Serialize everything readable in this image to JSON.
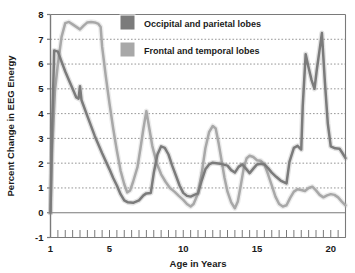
{
  "chart_data": {
    "type": "line",
    "title": "",
    "xlabel": "Age in Years",
    "ylabel": "Percent Change in EEG Energy",
    "xlim": [
      1,
      21
    ],
    "ylim": [
      -1,
      8
    ],
    "xticks": [
      1,
      5,
      10,
      15,
      20
    ],
    "yticks": [
      -1,
      0,
      1,
      2,
      3,
      4,
      5,
      6,
      7,
      8
    ],
    "xtick_labels": [
      "1",
      "5",
      "10",
      "15",
      "20"
    ],
    "ytick_labels": [
      "-1",
      "0",
      "1",
      "2",
      "3",
      "4",
      "5",
      "6",
      "7",
      "8"
    ],
    "grid": "horizontal-dotted",
    "minor_xticks_step": 0.5,
    "legend_position": "top-center",
    "series": [
      {
        "name": "Occipital and parietal lobes",
        "color": "#7b7b7b",
        "points": [
          [
            1.0,
            0.0
          ],
          [
            1.1,
            3.2
          ],
          [
            1.25,
            6.55
          ],
          [
            1.5,
            6.5
          ],
          [
            1.75,
            6.1
          ],
          [
            2.0,
            5.7
          ],
          [
            2.25,
            5.35
          ],
          [
            2.5,
            5.0
          ],
          [
            2.75,
            4.65
          ],
          [
            2.9,
            4.6
          ],
          [
            3.0,
            5.1
          ],
          [
            3.1,
            4.55
          ],
          [
            3.5,
            3.9
          ],
          [
            4.0,
            3.1
          ],
          [
            4.5,
            2.4
          ],
          [
            5.0,
            1.75
          ],
          [
            5.25,
            1.4
          ],
          [
            5.5,
            1.1
          ],
          [
            5.75,
            0.75
          ],
          [
            6.0,
            0.5
          ],
          [
            6.25,
            0.42
          ],
          [
            6.6,
            0.4
          ],
          [
            7.0,
            0.5
          ],
          [
            7.3,
            0.7
          ],
          [
            7.5,
            0.78
          ],
          [
            7.8,
            0.8
          ],
          [
            8.0,
            1.6
          ],
          [
            8.25,
            2.35
          ],
          [
            8.5,
            2.68
          ],
          [
            8.75,
            2.62
          ],
          [
            9.0,
            2.35
          ],
          [
            9.25,
            1.9
          ],
          [
            9.5,
            1.5
          ],
          [
            9.75,
            1.1
          ],
          [
            10.0,
            0.8
          ],
          [
            10.25,
            0.68
          ],
          [
            10.5,
            0.65
          ],
          [
            10.75,
            0.72
          ],
          [
            11.0,
            0.78
          ],
          [
            11.25,
            1.3
          ],
          [
            11.5,
            1.75
          ],
          [
            11.75,
            1.95
          ],
          [
            12.0,
            2.02
          ],
          [
            12.5,
            1.98
          ],
          [
            13.0,
            1.9
          ],
          [
            13.25,
            1.72
          ],
          [
            13.5,
            1.62
          ],
          [
            13.75,
            1.85
          ],
          [
            14.0,
            1.95
          ],
          [
            14.25,
            1.78
          ],
          [
            14.5,
            1.6
          ],
          [
            14.75,
            1.78
          ],
          [
            15.0,
            1.95
          ],
          [
            15.25,
            1.98
          ],
          [
            15.5,
            1.95
          ],
          [
            15.75,
            1.8
          ],
          [
            16.0,
            1.62
          ],
          [
            16.3,
            1.45
          ],
          [
            16.6,
            1.3
          ],
          [
            17.0,
            1.18
          ],
          [
            17.2,
            2.05
          ],
          [
            17.5,
            2.62
          ],
          [
            17.75,
            2.7
          ],
          [
            18.0,
            2.55
          ],
          [
            18.1,
            4.3
          ],
          [
            18.3,
            6.4
          ],
          [
            18.5,
            5.85
          ],
          [
            18.7,
            5.35
          ],
          [
            18.9,
            5.0
          ],
          [
            19.05,
            5.75
          ],
          [
            19.25,
            6.6
          ],
          [
            19.4,
            7.25
          ],
          [
            19.6,
            5.3
          ],
          [
            19.8,
            3.6
          ],
          [
            20.0,
            2.68
          ],
          [
            20.3,
            2.6
          ],
          [
            20.6,
            2.58
          ],
          [
            20.8,
            2.4
          ],
          [
            21.0,
            2.2
          ]
        ]
      },
      {
        "name": "Frontal and temporal lobes",
        "color": "#a8a8a8",
        "points": [
          [
            1.0,
            0.0
          ],
          [
            1.1,
            2.4
          ],
          [
            1.3,
            4.9
          ],
          [
            1.5,
            6.0
          ],
          [
            1.75,
            7.1
          ],
          [
            2.0,
            7.65
          ],
          [
            2.25,
            7.7
          ],
          [
            2.5,
            7.6
          ],
          [
            2.75,
            7.5
          ],
          [
            3.0,
            7.4
          ],
          [
            3.25,
            7.55
          ],
          [
            3.5,
            7.68
          ],
          [
            3.75,
            7.7
          ],
          [
            4.0,
            7.68
          ],
          [
            4.25,
            7.62
          ],
          [
            4.4,
            7.5
          ],
          [
            4.5,
            6.7
          ],
          [
            4.75,
            5.5
          ],
          [
            5.0,
            4.4
          ],
          [
            5.25,
            3.4
          ],
          [
            5.5,
            2.5
          ],
          [
            5.75,
            1.7
          ],
          [
            6.0,
            1.15
          ],
          [
            6.2,
            0.82
          ],
          [
            6.4,
            0.9
          ],
          [
            6.6,
            1.25
          ],
          [
            6.9,
            1.85
          ],
          [
            7.1,
            2.6
          ],
          [
            7.3,
            3.4
          ],
          [
            7.5,
            4.1
          ],
          [
            7.7,
            3.4
          ],
          [
            7.9,
            2.7
          ],
          [
            8.2,
            2.0
          ],
          [
            8.5,
            1.55
          ],
          [
            8.8,
            1.25
          ],
          [
            9.1,
            1.0
          ],
          [
            9.4,
            0.85
          ],
          [
            9.7,
            0.68
          ],
          [
            10.0,
            0.52
          ],
          [
            10.25,
            0.35
          ],
          [
            10.5,
            0.25
          ],
          [
            10.7,
            0.35
          ],
          [
            11.0,
            0.78
          ],
          [
            11.25,
            1.6
          ],
          [
            11.5,
            2.6
          ],
          [
            11.75,
            3.25
          ],
          [
            12.0,
            3.5
          ],
          [
            12.2,
            3.4
          ],
          [
            12.4,
            2.8
          ],
          [
            12.6,
            2.1
          ],
          [
            12.8,
            1.4
          ],
          [
            13.0,
            0.85
          ],
          [
            13.25,
            0.42
          ],
          [
            13.5,
            0.18
          ],
          [
            13.7,
            0.45
          ],
          [
            13.9,
            1.1
          ],
          [
            14.1,
            1.8
          ],
          [
            14.3,
            2.2
          ],
          [
            14.5,
            2.3
          ],
          [
            14.75,
            2.25
          ],
          [
            15.0,
            2.12
          ],
          [
            15.25,
            2.1
          ],
          [
            15.5,
            1.95
          ],
          [
            15.75,
            1.55
          ],
          [
            16.0,
            1.1
          ],
          [
            16.25,
            0.65
          ],
          [
            16.5,
            0.35
          ],
          [
            16.75,
            0.25
          ],
          [
            17.0,
            0.3
          ],
          [
            17.25,
            0.6
          ],
          [
            17.5,
            0.85
          ],
          [
            17.75,
            0.95
          ],
          [
            18.0,
            0.92
          ],
          [
            18.25,
            0.88
          ],
          [
            18.5,
            1.0
          ],
          [
            18.75,
            1.05
          ],
          [
            19.0,
            0.9
          ],
          [
            19.25,
            0.72
          ],
          [
            19.5,
            0.62
          ],
          [
            19.75,
            0.7
          ],
          [
            20.0,
            0.75
          ],
          [
            20.25,
            0.72
          ],
          [
            20.5,
            0.62
          ],
          [
            20.75,
            0.45
          ],
          [
            21.0,
            0.3
          ]
        ]
      }
    ],
    "zero_line": 0,
    "axis_color": "#7a7a7a",
    "grid_color": "#8a8a8a"
  },
  "legend": {
    "items": [
      {
        "label": "Occipital and parietal lobes",
        "color": "#7b7b7b"
      },
      {
        "label": "Frontal and temporal lobes",
        "color": "#a8a8a8"
      }
    ]
  },
  "axes": {
    "y_title": "Percent Change in EEG Energy",
    "x_title": "Age in Years"
  }
}
